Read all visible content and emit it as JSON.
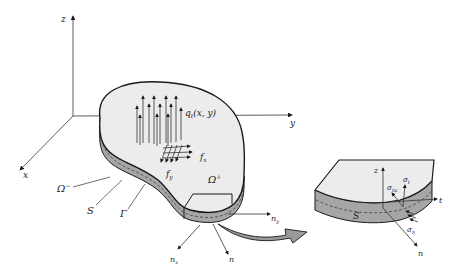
{
  "figure": {
    "colors": {
      "stroke": "#1a1a1a",
      "top_fill": "#ececec",
      "side_fill": "#a6a6a6",
      "arrow_fill": "#9a9a9a",
      "background": "#ffffff"
    },
    "axes": {
      "z_label": "z",
      "y_label": "y",
      "x_label": "x"
    },
    "loads": {
      "pressure_label": "q",
      "pressure_subscript": "t",
      "pressure_args": "(x, y)",
      "fx_label": "f",
      "fx_subscript": "x",
      "fy_label": "f",
      "fy_subscript": "y"
    },
    "regions": {
      "omega_plus": "Ω",
      "omega_plus_sup": "+",
      "omega_minus": "Ω",
      "omega_minus_sup": "−",
      "surface_S": "S",
      "boundary_gamma": "Γ"
    },
    "normals": {
      "nx_label": "n",
      "nx_sub": "x",
      "ny_label": "n",
      "ny_sub": "y",
      "n_label": "n"
    },
    "detail": {
      "z_label": "z",
      "t_label": "t",
      "n_label": "n",
      "S_label": "S",
      "sigma_nz": "σ",
      "sigma_nz_sub": "nz",
      "sigma_t": "σ",
      "sigma_t_sub": "t",
      "sigma_n": "σ",
      "sigma_n_sub": "n"
    }
  }
}
